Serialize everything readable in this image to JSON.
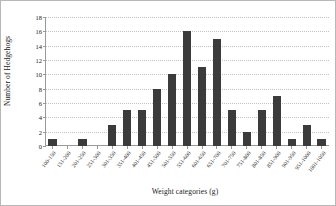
{
  "chart_data": {
    "type": "bar",
    "title": "",
    "xlabel": "Weight categories (g)",
    "ylabel": "Number of Hedgehogs",
    "ylim": [
      0,
      18
    ],
    "yticks": [
      0,
      2,
      4,
      6,
      8,
      10,
      12,
      14,
      16,
      18
    ],
    "grid": true,
    "legend": false,
    "bar_color": "#3b3b3b",
    "categories": [
      "100-150",
      "151-200",
      "201-250",
      "251-300",
      "301-350",
      "351-400",
      "401-450",
      "451-500",
      "501-550",
      "551-600",
      "601-650",
      "651-700",
      "701-750",
      "751-800",
      "801-850",
      "851-900",
      "901-950",
      "951-1000",
      "1001-1050"
    ],
    "values": [
      1,
      0,
      1,
      0,
      3,
      5,
      5,
      8,
      10,
      16,
      11,
      15,
      5,
      2,
      5,
      7,
      1,
      3,
      1
    ]
  }
}
